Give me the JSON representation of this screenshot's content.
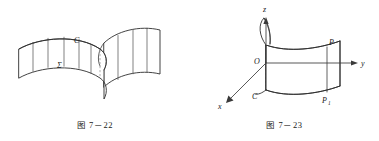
{
  "page": {
    "width": 379,
    "height": 141,
    "background": "#ffffff",
    "ink_color": "#2e2e2e",
    "dash_color": "#8c8c8c"
  },
  "figures": [
    {
      "id": "figure-7-22",
      "caption": "图 7－22",
      "description": "S-shaped ruled cylindrical surface (curtain) standing on a space curve",
      "labels": [
        {
          "name": "curve-label-C",
          "text": "C",
          "x": 74,
          "y": 43
        },
        {
          "name": "surface-label-sigma",
          "text": "Σ",
          "x": 57,
          "y": 68
        }
      ]
    },
    {
      "id": "figure-7-23",
      "caption": "图 7－23",
      "description": "Cylindrical surface over curve C in the xyz coordinate system with points P and P1",
      "axes": [
        {
          "name": "axis-z",
          "label": "z"
        },
        {
          "name": "axis-y",
          "label": "y"
        },
        {
          "name": "axis-x",
          "label": "x"
        }
      ],
      "labels": [
        {
          "name": "origin-label",
          "text": "O",
          "x": 69,
          "y": 63
        },
        {
          "name": "axis-label-z",
          "text": "z",
          "x": 84,
          "y": 13
        },
        {
          "name": "axis-label-y",
          "text": "y",
          "x": 170,
          "y": 65
        },
        {
          "name": "axis-label-x",
          "text": "x",
          "x": 31,
          "y": 105
        },
        {
          "name": "point-label-P",
          "text": "P",
          "x": 139,
          "y": 48
        },
        {
          "name": "point-label-P1-base",
          "text": "P",
          "x": 128,
          "y": 103
        },
        {
          "name": "point-label-P1-subscript",
          "text": "1",
          "x": 133,
          "y": 105
        },
        {
          "name": "curve-label-C",
          "text": "C",
          "x": 72,
          "y": 98
        }
      ]
    }
  ]
}
